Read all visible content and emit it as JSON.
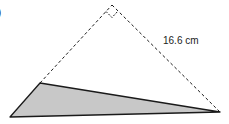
{
  "diagram": {
    "part_label": ")",
    "side_length_label": "16.6 cm",
    "colors": {
      "stroke": "#1a1a1a",
      "shade": "#c8c8c8"
    },
    "vertices": {
      "apex": [
        112,
        5
      ],
      "left_dash_end": [
        40,
        83
      ],
      "bottom_left": [
        10,
        117
      ],
      "right": [
        220,
        112
      ]
    },
    "right_angle_marker": true
  }
}
